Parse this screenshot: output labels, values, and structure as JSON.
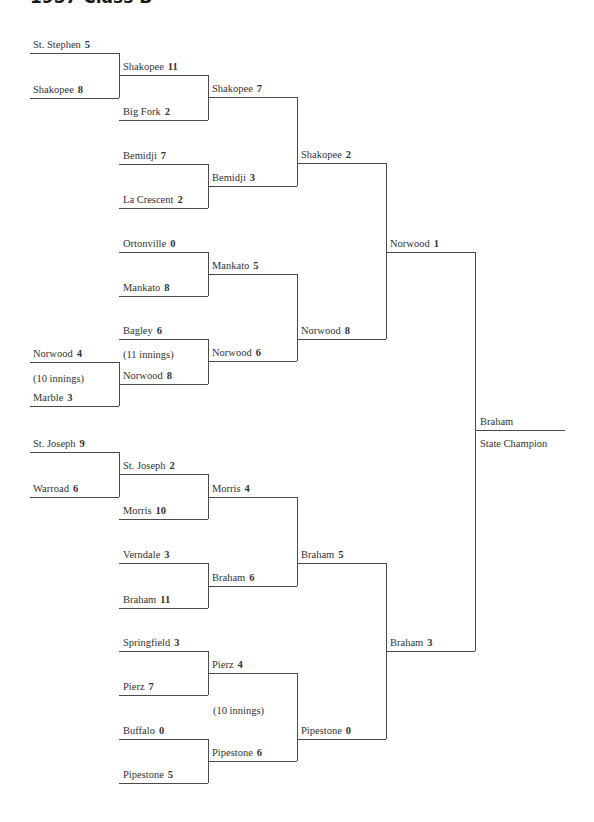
{
  "title": "1957 Class B",
  "champion": {
    "team": "Braham",
    "caption": "State Champion"
  },
  "round1": [
    {
      "team": "St. Stephen",
      "score": "5"
    },
    {
      "team": "Shakopee",
      "score": "8"
    },
    {
      "team": "Norwood",
      "score": "4"
    },
    {
      "team": "Marble",
      "score": "3"
    },
    {
      "team": "St. Joseph",
      "score": "9"
    },
    {
      "team": "Warroad",
      "score": "6"
    }
  ],
  "round1_notes": {
    "norwood_marble": "(10 innings)"
  },
  "round2": [
    {
      "team": "Shakopee",
      "score": "11"
    },
    {
      "team": "Big Fork",
      "score": "2"
    },
    {
      "team": "Bemidji",
      "score": "7"
    },
    {
      "team": "La Crescent",
      "score": "2"
    },
    {
      "team": "Ortonville",
      "score": "0"
    },
    {
      "team": "Mankato",
      "score": "8"
    },
    {
      "team": "Bagley",
      "score": "6"
    },
    {
      "team": "Norwood",
      "score": "8"
    },
    {
      "team": "St. Joseph",
      "score": "2"
    },
    {
      "team": "Morris",
      "score": "10"
    },
    {
      "team": "Verndale",
      "score": "3"
    },
    {
      "team": "Braham",
      "score": "11"
    },
    {
      "team": "Springfield",
      "score": "3"
    },
    {
      "team": "Pierz",
      "score": "7"
    },
    {
      "team": "Buffalo",
      "score": "0"
    },
    {
      "team": "Pipestone",
      "score": "5"
    }
  ],
  "round2_notes": {
    "bagley_norwood": "(11 innings)",
    "pierz_pipestone": "(10 innings)"
  },
  "round3": [
    {
      "team": "Shakopee",
      "score": "7"
    },
    {
      "team": "Bemidji",
      "score": "3"
    },
    {
      "team": "Mankato",
      "score": "5"
    },
    {
      "team": "Norwood",
      "score": "6"
    },
    {
      "team": "Morris",
      "score": "4"
    },
    {
      "team": "Braham",
      "score": "6"
    },
    {
      "team": "Pierz",
      "score": "4"
    },
    {
      "team": "Pipestone",
      "score": "6"
    }
  ],
  "semifinals": [
    {
      "team": "Shakopee",
      "score": "2"
    },
    {
      "team": "Norwood",
      "score": "8"
    },
    {
      "team": "Braham",
      "score": "5"
    },
    {
      "team": "Pipestone",
      "score": "0"
    }
  ],
  "finals": [
    {
      "team": "Norwood",
      "score": "1"
    },
    {
      "team": "Braham",
      "score": "3"
    }
  ]
}
